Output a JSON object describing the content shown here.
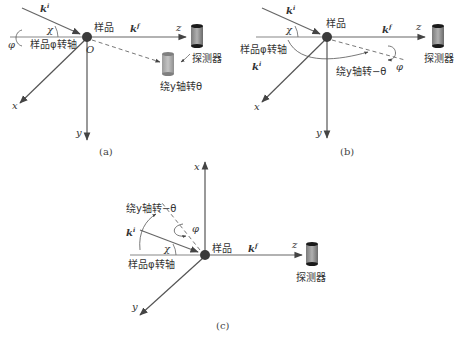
{
  "colors": {
    "axis": "#555555",
    "beam": "#666666",
    "sample_dot": "#3a3a3a",
    "detector_body": "#9a9a9a",
    "detector_cap": "#1a1a1a",
    "text": "#333333"
  },
  "panel_a": {
    "caption": "(a)",
    "sample_label": "样品",
    "origin_label": "O",
    "incident_wave": "k",
    "incident_sup": "i",
    "scattered_wave": "k",
    "scattered_sup": "f",
    "chi": "χ",
    "phi": "φ",
    "phi_axis_label": "样品φ转轴",
    "axis_x": "x",
    "axis_y": "y",
    "axis_z": "z",
    "detector_label": "探测器",
    "rotation_label": "绕y轴转θ"
  },
  "panel_b": {
    "caption": "(b)",
    "sample_label": "样品",
    "incident_wave": "k",
    "incident_sup": "i",
    "scattered_wave": "k",
    "scattered_sup": "f",
    "chi": "χ",
    "phi": "φ",
    "phi_axis_label": "样品φ转轴",
    "axis_x": "x",
    "axis_y": "y",
    "axis_z": "z",
    "detector_label": "探测器",
    "rotation_label": "绕y轴转−θ"
  },
  "panel_c": {
    "caption": "(c)",
    "sample_label": "样品",
    "incident_wave": "k",
    "incident_sup": "i",
    "scattered_wave": "k",
    "scattered_sup": "f",
    "chi": "χ",
    "phi": "φ",
    "phi_axis_label": "样品φ转轴",
    "axis_x": "x",
    "axis_y": "y",
    "axis_z": "z",
    "detector_label": "探测器",
    "rotation_label": "绕y轴转−θ"
  }
}
